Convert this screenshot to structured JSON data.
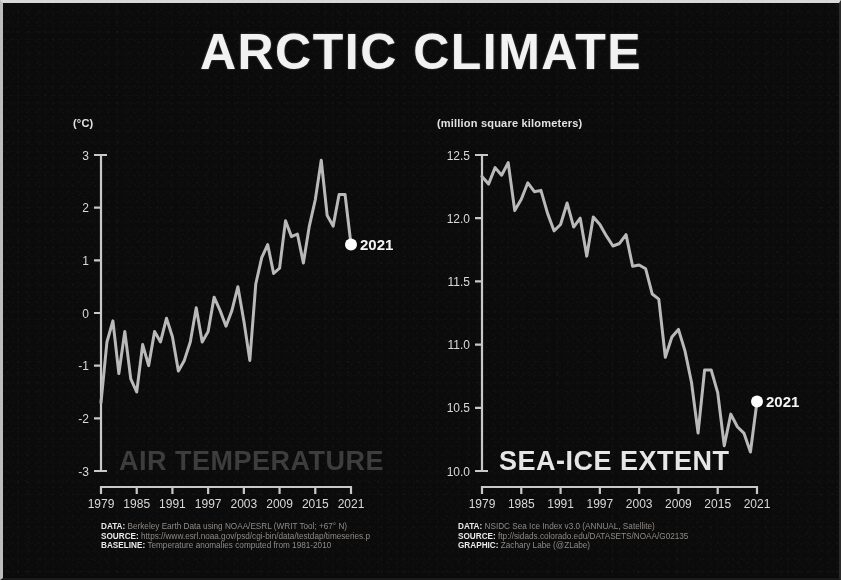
{
  "title": "ARCTIC CLIMATE",
  "colors": {
    "background": "#0b0b0b",
    "line": "#b9b9b9",
    "marker": "#ffffff",
    "axis": "#c8c8c8",
    "title_left": "#3c3c3c",
    "title_right": "#e6e6e6"
  },
  "left_panel": {
    "unit_label": "(°C)",
    "chart_title": "AIR TEMPERATURE",
    "end_label": "2021",
    "credits": [
      {
        "key": "DATA:",
        "text": "Berkeley Earth Data using NOAA/ESRL (WRIT Tool; +67° N)"
      },
      {
        "key": "SOURCE:",
        "text": "https://www.esrl.noaa.gov/psd/cgi-bin/data/testdap/timeseries.p"
      },
      {
        "key": "BASELINE:",
        "text": "Temperature anomalies computed from 1981-2010"
      }
    ]
  },
  "right_panel": {
    "unit_label": "(million square kilometers)",
    "chart_title": "SEA-ICE EXTENT",
    "end_label": "2021",
    "credits": [
      {
        "key": "DATA:",
        "text": "NSIDC Sea Ice Index v3.0 (ANNUAL, Satellite)"
      },
      {
        "key": "SOURCE:",
        "text": "ftp://sidads.colorado.edu/DATASETS/NOAA/G02135"
      },
      {
        "key": "GRAPHIC:",
        "text": "Zachary Labe (@ZLabe)"
      }
    ]
  },
  "chart_data": [
    {
      "type": "line",
      "id": "air-temperature",
      "title": "AIR TEMPERATURE",
      "xlabel": "",
      "ylabel": "(°C)",
      "ylim": [
        -3,
        3
      ],
      "yticks": [
        3,
        2,
        1,
        0,
        -1,
        -2,
        -3
      ],
      "ytick_labels": [
        "3",
        "2",
        "1",
        "0",
        "-1",
        "-2",
        "-3"
      ],
      "xlim": [
        1979,
        2021
      ],
      "xticks": [
        1979,
        1985,
        1991,
        1997,
        2003,
        2009,
        2015,
        2021
      ],
      "xtick_labels": [
        "1979",
        "1985",
        "1991",
        "1997",
        "2003",
        "2009",
        "2015",
        "2021"
      ],
      "grid": false,
      "legend": "none",
      "annotations": [
        {
          "label": "2021",
          "x": 2021,
          "y": 1.3,
          "marker": "circle"
        }
      ],
      "x": [
        1979,
        1980,
        1981,
        1982,
        1983,
        1984,
        1985,
        1986,
        1987,
        1988,
        1989,
        1990,
        1991,
        1992,
        1993,
        1994,
        1995,
        1996,
        1997,
        1998,
        1999,
        2000,
        2001,
        2002,
        2003,
        2004,
        2005,
        2006,
        2007,
        2008,
        2009,
        2010,
        2011,
        2012,
        2013,
        2014,
        2015,
        2016,
        2017,
        2018,
        2019,
        2020,
        2021
      ],
      "values": [
        -1.7,
        -0.55,
        -0.15,
        -1.15,
        -0.35,
        -1.25,
        -1.5,
        -0.6,
        -1.0,
        -0.35,
        -0.55,
        -0.1,
        -0.45,
        -1.1,
        -0.9,
        -0.55,
        0.1,
        -0.55,
        -0.35,
        0.3,
        0.05,
        -0.25,
        0.05,
        0.5,
        -0.15,
        -0.9,
        0.55,
        1.05,
        1.3,
        0.75,
        0.85,
        1.75,
        1.45,
        1.5,
        0.95,
        1.65,
        2.15,
        2.9,
        1.85,
        1.65,
        2.25,
        2.25,
        1.3
      ]
    },
    {
      "type": "line",
      "id": "sea-ice-extent",
      "title": "SEA-ICE EXTENT",
      "xlabel": "",
      "ylabel": "(million square kilometers)",
      "ylim": [
        10.0,
        12.5
      ],
      "yticks": [
        12.5,
        12.0,
        11.5,
        11.0,
        10.5,
        10.0
      ],
      "ytick_labels": [
        "12.5",
        "12.0",
        "11.5",
        "11.0",
        "10.5",
        "10.0"
      ],
      "xlim": [
        1979,
        2021
      ],
      "xticks": [
        1979,
        1985,
        1991,
        1997,
        2003,
        2009,
        2015,
        2021
      ],
      "xtick_labels": [
        "1979",
        "1985",
        "1991",
        "1997",
        "2003",
        "2009",
        "2015",
        "2021"
      ],
      "grid": false,
      "legend": "none",
      "annotations": [
        {
          "label": "2021",
          "x": 2021,
          "y": 10.55,
          "marker": "circle"
        }
      ],
      "x": [
        1979,
        1980,
        1981,
        1982,
        1983,
        1984,
        1985,
        1986,
        1987,
        1988,
        1989,
        1990,
        1991,
        1992,
        1993,
        1994,
        1995,
        1996,
        1997,
        1998,
        1999,
        2000,
        2001,
        2002,
        2003,
        2004,
        2005,
        2006,
        2007,
        2008,
        2009,
        2010,
        2011,
        2012,
        2013,
        2014,
        2015,
        2016,
        2017,
        2018,
        2019,
        2020,
        2021
      ],
      "values": [
        12.33,
        12.27,
        12.4,
        12.34,
        12.44,
        12.06,
        12.15,
        12.28,
        12.21,
        12.22,
        12.04,
        11.9,
        11.95,
        12.12,
        11.93,
        12.0,
        11.7,
        12.01,
        11.95,
        11.86,
        11.78,
        11.8,
        11.87,
        11.62,
        11.63,
        11.6,
        11.4,
        11.36,
        10.9,
        11.06,
        11.12,
        10.95,
        10.7,
        10.3,
        10.8,
        10.8,
        10.62,
        10.2,
        10.45,
        10.35,
        10.3,
        10.15,
        10.55
      ]
    }
  ]
}
